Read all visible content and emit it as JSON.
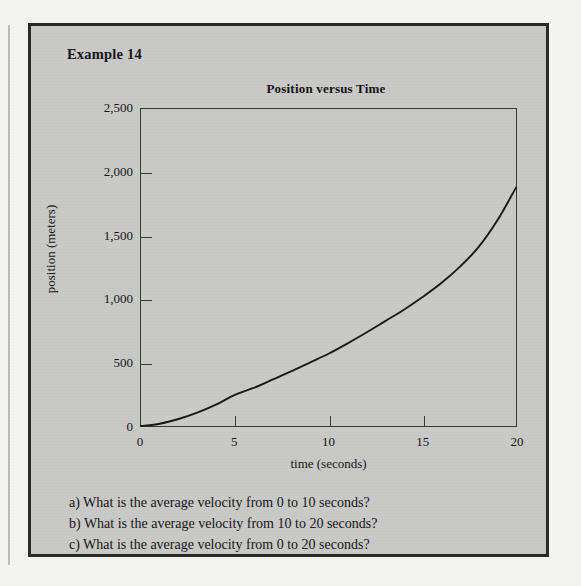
{
  "figure": {
    "example_label": "Example 14",
    "background_color": "#c9c9c7",
    "border_color": "#2b2b2b",
    "page_color": "#f4f4f2"
  },
  "chart_data": {
    "type": "line",
    "title": "Position versus Time",
    "xlabel": "time (seconds)",
    "ylabel": "position (meters)",
    "xlim": [
      0,
      20
    ],
    "ylim": [
      0,
      2500
    ],
    "xticks": [
      0,
      5,
      10,
      15,
      20
    ],
    "yticks": [
      0,
      500,
      1000,
      1500,
      2000,
      2500
    ],
    "xtick_labels": [
      "0",
      "5",
      "10",
      "15",
      "20"
    ],
    "ytick_labels": [
      "0",
      "500",
      "1,000",
      "1,500",
      "2,000",
      "2,500"
    ],
    "grid": false,
    "legend": false,
    "line_color": "#1a1a1a",
    "series": [
      {
        "name": "position",
        "x": [
          0,
          1,
          2,
          3,
          4,
          5,
          6,
          7,
          8,
          9,
          10,
          11,
          12,
          13,
          14,
          15,
          16,
          17,
          18,
          19,
          20
        ],
        "y": [
          0,
          18,
          55,
          105,
          168,
          245,
          300,
          365,
          430,
          500,
          570,
          650,
          735,
          825,
          915,
          1015,
          1125,
          1255,
          1410,
          1620,
          1880
        ]
      }
    ],
    "annotations": []
  },
  "questions": [
    "a) What is the average velocity from 0 to 10 seconds?",
    "b) What is the average velocity from 10 to 20 seconds?",
    "c) What is the average velocity from 0 to 20 seconds?"
  ]
}
